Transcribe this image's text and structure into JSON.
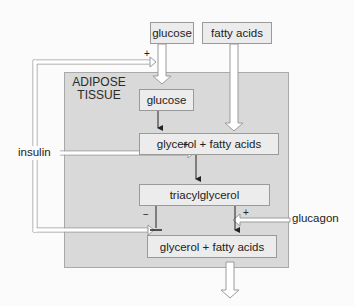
{
  "diagram": {
    "region_label": "ADIPOSE\nTISSUE",
    "region_label_line1": "ADIPOSE",
    "region_label_line2": "TISSUE",
    "external_inputs": {
      "glucose": "glucose",
      "fatty_acids": "fatty acids"
    },
    "nodes": {
      "glucose_inner": "glucose",
      "glycerol_fatty_acids_1": "glycerol + fatty acids",
      "triacylglycerol": "triacylglycerol",
      "glycerol_fatty_acids_2": "glycerol + fatty acids"
    },
    "regulators": {
      "insulin": "insulin",
      "glucagon": "glucagon"
    },
    "signs": {
      "insulin_glucose_uptake": "+",
      "insulin_esterification": "+",
      "insulin_lipolysis": "−",
      "glucagon_lipolysis": "+"
    },
    "edges": [
      {
        "from": "glucose (blood)",
        "to": "glucose (adipose)",
        "type": "transport"
      },
      {
        "from": "fatty acids (blood)",
        "to": "glycerol + fatty acids",
        "type": "transport"
      },
      {
        "from": "glucose (adipose)",
        "to": "glycerol + fatty acids",
        "type": "conversion"
      },
      {
        "from": "glycerol + fatty acids",
        "to": "triacylglycerol",
        "type": "conversion"
      },
      {
        "from": "triacylglycerol",
        "to": "glycerol + fatty acids",
        "type": "conversion"
      },
      {
        "from": "glycerol + fatty acids",
        "to": "out",
        "type": "export"
      },
      {
        "from": "insulin",
        "to": "glucose uptake",
        "effect": "+"
      },
      {
        "from": "insulin",
        "to": "triacylglycerol synthesis",
        "effect": "+"
      },
      {
        "from": "insulin",
        "to": "lipolysis",
        "effect": "−"
      },
      {
        "from": "glucagon",
        "to": "lipolysis",
        "effect": "+"
      }
    ],
    "colors": {
      "background": "#fbfbfb",
      "tissue_fill": "#d9d9d9",
      "box_fill": "#ececec",
      "border": "#9a9a9a",
      "hollow_arrow_fill": "#ffffff",
      "hollow_arrow_stroke": "#999999"
    }
  }
}
